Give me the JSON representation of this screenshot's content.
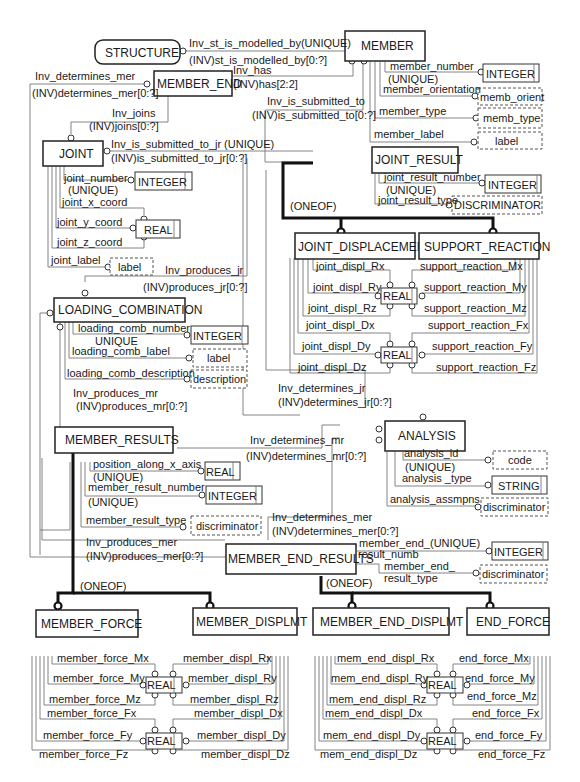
{
  "entities": {
    "structure": "STRUCTURE",
    "member": "MEMBER",
    "member_end": "MEMBER_END",
    "joint": "JOINT",
    "joint_result": "JOINT_RESULT",
    "joint_displacement": "JOINT_DISPLACEMENT",
    "support_reaction": "SUPPORT_REACTION",
    "loading_combination": "LOADING_COMBINATION",
    "member_results": "MEMBER_RESULTS",
    "analysis": "ANALYSIS",
    "member_end_results": "MEMBER_END_RESULTS",
    "member_force": "MEMBER_FORCE",
    "member_displmt": "MEMBER_DISPLMT",
    "member_end_displmt": "MEMBER_END_DISPLMT",
    "end_force": "END_FORCE"
  },
  "relations": {
    "st_modelled_1": "Inv_st_is_modelled_by(UNIQUE)",
    "st_modelled_2": "(INV)st_is_modelled_by[0:?]",
    "det_mer_1": "Inv_determines_mer",
    "det_mer_2": "(INV)determines_mer[0:?]",
    "has_1": "Inv_has",
    "has_2": "(INV)has[2:2]",
    "submitted_1": "Inv_is_submitted_to",
    "submitted_2": "(INV)is_submitted_to[0:?]",
    "joins_1": "Inv_joins",
    "joins_2": "(INV)joins[0:?]",
    "sub_jr_1": "Inv_is_submitted_to_jr (UNIQUE)",
    "sub_jr_2": "(INV)is_submitted_to_jr[0:?]",
    "prod_jr_1": "Inv_produces_jr",
    "prod_jr_2": "(INV)produces_jr[0:?]",
    "prod_mr_1": "Inv_produces_mr",
    "prod_mr_2": "(INV)produces_mr[0:?]",
    "det_jr_1": "Inv_determines_jr",
    "det_jr_2": "(INV)determines_jr[0:?]",
    "det_mr_1": "Inv_determines_mr",
    "det_mr_2": "(INV)determines_mr[0:?]",
    "det_mer2_1": "Inv_determines_mer",
    "det_mer2_2": "(INV)determines_mer[0:?]",
    "prod_mer_1": "Inv_produces_mer",
    "prod_mer_2": "(INV)produces_mer[0:?]",
    "oneof_jr": "(ONEOF)",
    "oneof_mr": "(ONEOF)",
    "oneof_mer": "(ONEOF)"
  },
  "types": {
    "integer": "INTEGER",
    "real": "REAL",
    "string": "STRING",
    "label": "label",
    "memb_orient": "memb_orient",
    "memb_type": "memb_type",
    "discriminator_upper": "DISCRIMINATOR",
    "discriminator": "discriminator",
    "description": "description",
    "code": "code"
  },
  "member_attrs": {
    "number": "member_number",
    "unique": "(UNIQUE)",
    "orientation": "member_orientation",
    "type": "member_type",
    "label": "member_label"
  },
  "joint_attrs": {
    "number": "joint_number",
    "unique": "(UNIQUE)",
    "x": "joint_x_coord",
    "y": "joint_y_coord",
    "z": "joint_z_coord",
    "label": "joint_label"
  },
  "joint_result_attrs": {
    "number": "joint_result_number",
    "unique": "(UNIQUE)",
    "type": "joint_result_type"
  },
  "joint_displ_attrs": [
    "joint_displ_Rx",
    "joint_displ_Ry",
    "joint_displ_Rz",
    "joint_displ_Dx",
    "joint_displ_Dy",
    "joint_displ_Dz"
  ],
  "support_reaction_attrs": [
    "support_reaction_Mx",
    "support_reaction_My",
    "support_reaction_Mz",
    "support_reaction_Fx",
    "support_reaction_Fy",
    "support_reaction_Fz"
  ],
  "loading_attrs": {
    "number": "loading_comb_number",
    "unique": "UNIQUE",
    "label": "loading_comb_label",
    "description": "loading_comb_description"
  },
  "member_results_attrs": {
    "position": "position_along_x_axis",
    "unique1": "(UNIQUE)",
    "number": "member_result_number",
    "unique2": "(UNIQUE)",
    "type": "member_result_type"
  },
  "analysis_attrs": {
    "id": "analysis_id",
    "unique": "(UNIQUE)",
    "type": "analysis _type",
    "assmpns": "analysis_assmpns"
  },
  "mer_attrs": {
    "numb_1": "member_end_",
    "numb_unique": "(UNIQUE)",
    "numb_2": "result_numb",
    "type_1": "member_end_",
    "type_2": "result_type"
  },
  "member_force_attrs": [
    "member_force_Mx",
    "member_force_My",
    "member_force_Mz",
    "member_force_Fx",
    "member_force_Fy",
    "member_force_Fz"
  ],
  "member_displ_attrs": [
    "member_displ_Rx",
    "member_displ_Ry",
    "member_displ_Rz",
    "member_displ_Dx",
    "member_displ_Dy",
    "member_displ_Dz"
  ],
  "mem_end_displ_attrs": [
    "mem_end_displ_Rx",
    "mem_end_displ_Ry",
    "mem_end_displ_Rz",
    "mem_end_displ_Dx",
    "mem_end_displ_Dy",
    "mem_end_displ_Dz"
  ],
  "end_force_attrs": [
    "end_force_Mx",
    "end_force_My",
    "end_force_Mz",
    "end_force_Fx",
    "end_force_Fy",
    "end_force_Fz"
  ]
}
